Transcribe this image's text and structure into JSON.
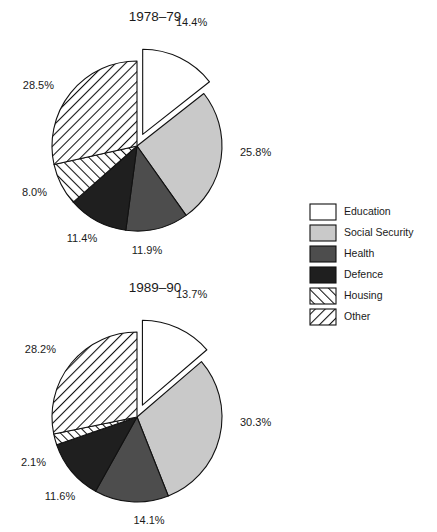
{
  "figure": {
    "width": 437,
    "height": 532,
    "background": "#ffffff"
  },
  "legend": {
    "name": "chart-legend",
    "x": 310,
    "y": 204,
    "swatch_width": 26,
    "swatch_height": 16,
    "row_height": 21,
    "label_offset_x": 34,
    "entries": [
      {
        "label": "Education",
        "key": "education",
        "fill": "#ffffff",
        "pattern": "solid"
      },
      {
        "label": "Social Security",
        "key": "social_security",
        "fill": "#c9c9c9",
        "pattern": "solid"
      },
      {
        "label": "Health",
        "key": "health",
        "fill": "#4d4d4d",
        "pattern": "solid"
      },
      {
        "label": "Defence",
        "key": "defence",
        "fill": "#1f1f1f",
        "pattern": "solid"
      },
      {
        "label": "Housing",
        "key": "housing",
        "fill": "#ffffff",
        "pattern": "hatch-forward"
      },
      {
        "label": "Other",
        "key": "other",
        "fill": "#ffffff",
        "pattern": "hatch-back"
      }
    ]
  },
  "chart_data": [
    {
      "type": "pie",
      "title": "1978–79",
      "name": "pie-1978-79",
      "center_x": 137,
      "center_y": 146,
      "radius": 85,
      "title_x": 155,
      "title_y": 21,
      "start_angle": -90,
      "explode_index": 0,
      "explode_distance": 13,
      "categories": [
        "Education",
        "Social Security",
        "Health",
        "Defence",
        "Housing",
        "Other"
      ],
      "values": [
        14.4,
        25.8,
        11.9,
        11.4,
        8.0,
        28.5
      ],
      "value_labels": [
        "14.4%",
        "25.8%",
        "11.9%",
        "11.4%",
        "8.0%",
        "28.5%"
      ],
      "label_positions": [
        {
          "x": 176,
          "y": 26,
          "anchor": "start"
        },
        {
          "x": 240,
          "y": 156,
          "anchor": "start"
        },
        {
          "x": 147,
          "y": 254,
          "anchor": "middle"
        },
        {
          "x": 82,
          "y": 242,
          "anchor": "middle"
        },
        {
          "x": 47,
          "y": 196,
          "anchor": "end"
        },
        {
          "x": 54,
          "y": 89,
          "anchor": "end"
        }
      ],
      "slice_fills": [
        "#ffffff",
        "#c9c9c9",
        "#4d4d4d",
        "#1f1f1f",
        "#ffffff",
        "#ffffff"
      ],
      "slice_patterns": [
        "solid",
        "solid",
        "solid",
        "solid",
        "hatch-forward",
        "hatch-back"
      ]
    },
    {
      "type": "pie",
      "title": "1989–90",
      "name": "pie-1989-90",
      "center_x": 137,
      "center_y": 417,
      "radius": 85,
      "title_x": 155,
      "title_y": 292,
      "start_angle": -90,
      "explode_index": 0,
      "explode_distance": 13,
      "categories": [
        "Education",
        "Social Security",
        "Health",
        "Defence",
        "Housing",
        "Other"
      ],
      "values": [
        13.7,
        30.3,
        14.1,
        11.6,
        2.1,
        28.2
      ],
      "value_labels": [
        "13.7%",
        "30.3%",
        "14.1%",
        "11.6%",
        "2.1%",
        "28.2%"
      ],
      "label_positions": [
        {
          "x": 176,
          "y": 298,
          "anchor": "start"
        },
        {
          "x": 240,
          "y": 426,
          "anchor": "start"
        },
        {
          "x": 149,
          "y": 524,
          "anchor": "middle"
        },
        {
          "x": 60,
          "y": 500,
          "anchor": "middle"
        },
        {
          "x": 46,
          "y": 466,
          "anchor": "end"
        },
        {
          "x": 56,
          "y": 353,
          "anchor": "end"
        }
      ],
      "slice_fills": [
        "#ffffff",
        "#c9c9c9",
        "#4d4d4d",
        "#1f1f1f",
        "#ffffff",
        "#ffffff"
      ],
      "slice_patterns": [
        "solid",
        "solid",
        "solid",
        "solid",
        "hatch-forward",
        "hatch-back"
      ]
    }
  ]
}
